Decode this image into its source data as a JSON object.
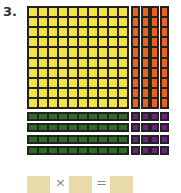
{
  "problem_number": "3.",
  "blocks": {
    "hundred_square": {
      "color": "#f3e443",
      "rows": 10,
      "cols": 10
    },
    "tens_columns": {
      "color": "#e8621f",
      "count": 4,
      "units": 10
    },
    "tens_rows": {
      "color": "#2e6b25",
      "count": 4,
      "units": 10
    },
    "ones": {
      "color": "#6b2580",
      "rows": 4,
      "cols": 4
    }
  },
  "equation": {
    "times": "×",
    "equals": "="
  }
}
